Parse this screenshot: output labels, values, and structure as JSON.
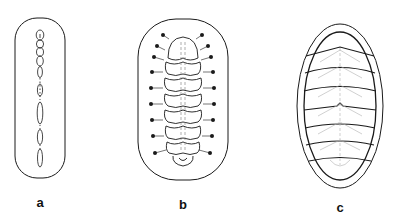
{
  "figure": {
    "panels": [
      {
        "id": "a",
        "label": "a",
        "label_x": 40,
        "label_y": 195
      },
      {
        "id": "b",
        "label": "b",
        "label_x": 183,
        "label_y": 197
      },
      {
        "id": "c",
        "label": "c",
        "label_x": 340,
        "label_y": 200
      }
    ],
    "colors": {
      "stroke": "#1a1a1a",
      "faint": "#9a9a9a"
    }
  }
}
